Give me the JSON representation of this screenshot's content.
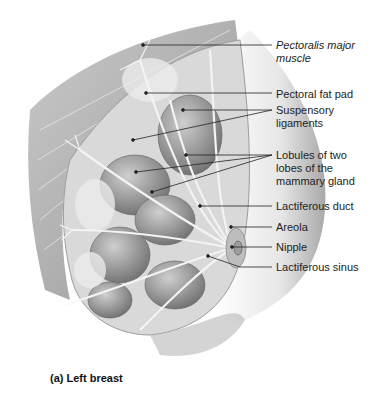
{
  "figure": {
    "caption": "(a) Left breast",
    "labels": [
      {
        "text": "Pectoralis major\nmuscle",
        "italic": true,
        "top": 39,
        "target": [
          143,
          45
        ]
      },
      {
        "text": "Pectoral fat pad",
        "italic": false,
        "top": 88,
        "target": [
          146,
          93
        ]
      },
      {
        "text": "Suspensory\nligaments",
        "italic": false,
        "top": 104,
        "target": [
          183,
          110
        ]
      },
      {
        "text": "Lobules of two\nlobes of the\nmammary gland",
        "italic": false,
        "top": 148,
        "target": [
          186,
          155
        ]
      },
      {
        "text": "Lactiferous duct",
        "italic": false,
        "top": 201,
        "target": [
          200,
          206
        ]
      },
      {
        "text": "Areola",
        "italic": false,
        "top": 221,
        "target": [
          231,
          227
        ]
      },
      {
        "text": "Nipple",
        "italic": false,
        "top": 241,
        "target": [
          232,
          247
        ]
      },
      {
        "text": "Lactiferous sinus",
        "italic": false,
        "top": 261,
        "target": [
          208,
          256
        ]
      }
    ],
    "colors": {
      "muscle": "#9a9a9a",
      "tissue": "#d6d6d6",
      "lobule": "#8e8e8e",
      "duct": "#f2f2f2",
      "skin": "#c8c8c8",
      "leader": "#222222"
    }
  }
}
